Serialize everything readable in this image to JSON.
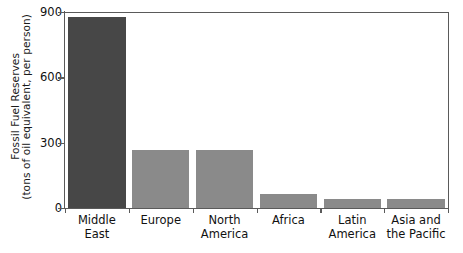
{
  "chart_data": {
    "type": "bar",
    "title": "",
    "subtitle": "",
    "xlabel": "",
    "ylabel": "Fossil Fuel Reserves (tons of oil equivalent, per person)",
    "ylabel_lines": [
      "Fossil Fuel Reserves",
      "(tons of oil equivalent, per person)"
    ],
    "categories": [
      "Middle East",
      "Europe",
      "North America",
      "Africa",
      "Latin America",
      "Asia and the Pacific"
    ],
    "category_lines": [
      [
        "Middle East"
      ],
      [
        "Europe"
      ],
      [
        "North",
        "America"
      ],
      [
        "Africa"
      ],
      [
        "Latin",
        "America"
      ],
      [
        "Asia and",
        "the Pacific"
      ]
    ],
    "values": [
      875,
      268,
      265,
      65,
      42,
      40
    ],
    "ylim": [
      0,
      900
    ],
    "yticks": [
      0,
      300,
      600,
      900
    ],
    "ytick_labels": [
      "0",
      "300",
      "600",
      "900"
    ],
    "grid": false,
    "legend": false,
    "legend_position": "none",
    "bar_colors": [
      "#474747",
      "#8a8a8a",
      "#8a8a8a",
      "#8a8a8a",
      "#8a8a8a",
      "#8a8a8a"
    ],
    "highlight_color": "#474747",
    "default_bar_color": "#8a8a8a",
    "axis_color": "#5a5a5a",
    "text_color": "#111111",
    "background_color": "#ffffff"
  }
}
